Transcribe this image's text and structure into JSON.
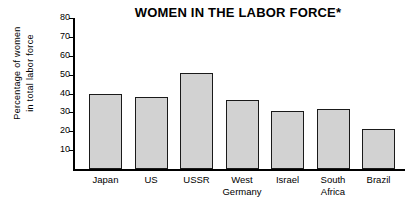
{
  "chart_data": {
    "type": "bar",
    "title": "WOMEN IN THE LABOR FORCE*",
    "xlabel": "",
    "ylabel": "Percentage of women in total labor force",
    "ylabel_lines": [
      "Percentage of women",
      "in total labor force"
    ],
    "categories": [
      "Japan",
      "US",
      "USSR",
      "West Germany",
      "Israel",
      "South Africa",
      "Brazil"
    ],
    "category_labels": [
      "Japan",
      "US",
      "USSR",
      "West\nGermany",
      "Israel",
      "South\nAfrica",
      "Brazil"
    ],
    "values": [
      39.5,
      38,
      51,
      36.5,
      31,
      32,
      21
    ],
    "ylim": [
      0,
      80
    ],
    "yticks": [
      10,
      20,
      30,
      40,
      50,
      60,
      70,
      80
    ],
    "ytick_labels": [
      "10",
      "20",
      "30",
      "40",
      "50",
      "60",
      "70",
      "80"
    ],
    "grid": false,
    "legend": null,
    "bar_color": "#d2d2d2",
    "bar_border_color": "#1a1a1a",
    "axis_color": "#000000",
    "background": "#ffffff"
  }
}
